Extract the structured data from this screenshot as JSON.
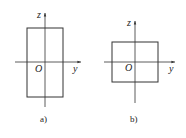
{
  "figures": [
    {
      "id": "a",
      "caption": "a)",
      "axis_labels": {
        "vertical": "z",
        "horizontal": "y",
        "origin": "O"
      },
      "shape": "tall rectangle"
    },
    {
      "id": "b",
      "caption": "b)",
      "axis_labels": {
        "vertical": "z",
        "horizontal": "y",
        "origin": "O"
      },
      "shape": "wide rectangle"
    }
  ],
  "colors": {
    "line": "#333333",
    "background": "#ffffff"
  }
}
